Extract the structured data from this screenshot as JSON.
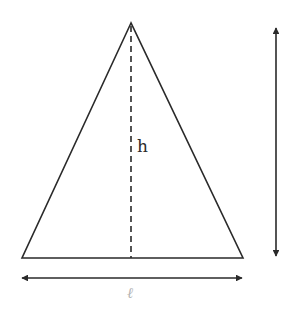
{
  "diagram": {
    "type": "isosceles-triangle-dimensions",
    "labels": {
      "height": "h",
      "base": "ℓ"
    },
    "colors": {
      "stroke": "#2a2a2a",
      "base_label": "#b4b4b4",
      "background": "#ffffff"
    },
    "elements": [
      "triangle",
      "height-dashed-line",
      "base-dimension-arrow",
      "vertical-dimension-arrow"
    ]
  }
}
